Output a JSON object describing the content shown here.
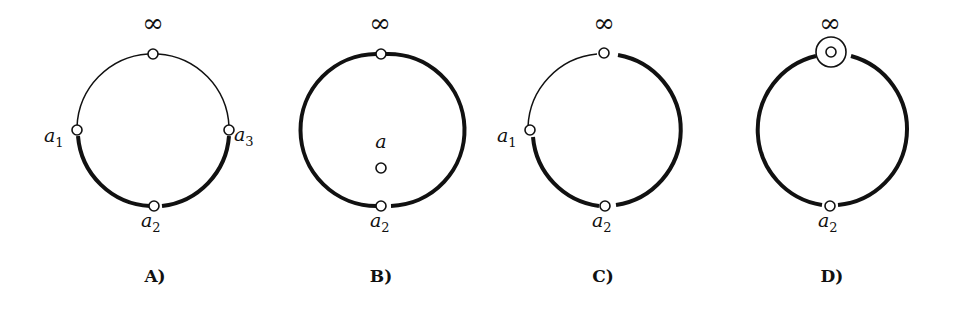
{
  "figure": {
    "panels": [
      {
        "id": "A",
        "caption": "A)",
        "center": [
          153,
          130
        ],
        "radius": 76,
        "points": [
          {
            "name": "infinity",
            "label": "∞",
            "angle": -90
          },
          {
            "name": "a1",
            "label": "a",
            "subscript": "1",
            "angle": 180
          },
          {
            "name": "a3",
            "label": "a",
            "subscript": "3",
            "angle": 0
          },
          {
            "name": "a2",
            "label": "a",
            "subscript": "2",
            "angle": 90
          }
        ],
        "thick_arcs": "lower half from a1 through a2 to a3",
        "thin_arcs": "upper half from a1 through infinity to a3"
      },
      {
        "id": "B",
        "caption": "B)",
        "center": [
          380,
          130
        ],
        "radius": 76,
        "points": [
          {
            "name": "infinity",
            "label": "∞",
            "angle": -90
          },
          {
            "name": "a2",
            "label": "a",
            "subscript": "2",
            "angle": 90
          }
        ],
        "interior_point": {
          "name": "a",
          "label": "a"
        },
        "thick_arcs": "entire circle (both halves)",
        "thin_arcs": "none"
      },
      {
        "id": "C",
        "caption": "C)",
        "center": [
          601,
          130
        ],
        "radius": 76,
        "points": [
          {
            "name": "infinity",
            "label": "∞",
            "angle": -90
          },
          {
            "name": "a1",
            "label": "a",
            "subscript": "1",
            "angle": 180
          },
          {
            "name": "a2",
            "label": "a",
            "subscript": "2",
            "angle": 90
          }
        ],
        "thick_arcs": "from a1 through a2 and right side up to infinity",
        "thin_arcs": "upper-left quarter from a1 to infinity"
      },
      {
        "id": "D",
        "caption": "D)",
        "center": [
          830,
          130
        ],
        "radius": 76,
        "points": [
          {
            "name": "infinity",
            "label": "∞",
            "angle": -90,
            "marker": "double-circle"
          },
          {
            "name": "a2",
            "label": "a",
            "subscript": "2",
            "angle": 90
          }
        ],
        "thick_arcs": "entire circle (both halves)",
        "thin_arcs": "none"
      }
    ]
  },
  "labels": {
    "infinity": "∞",
    "a": "a",
    "sub1": "1",
    "sub2": "2",
    "sub3": "3",
    "capA": "A)",
    "capB": "B)",
    "capC": "C)",
    "capD": "D)"
  }
}
